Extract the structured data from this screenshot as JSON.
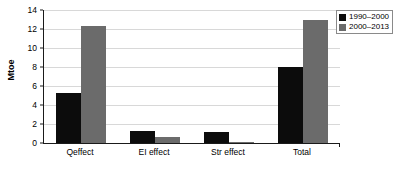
{
  "chart_data": {
    "type": "bar",
    "title": "",
    "xlabel": "",
    "ylabel": "Mtoe",
    "categories": [
      "Qeffect",
      "EI effect",
      "Str effect",
      "Total"
    ],
    "series": [
      {
        "name": "1990–2000",
        "color": "#0c0c0c",
        "values": [
          5.3,
          1.3,
          1.2,
          8.0
        ]
      },
      {
        "name": "2000–2013",
        "color": "#6b6b6b",
        "values": [
          12.3,
          0.6,
          0.1,
          13.0
        ]
      }
    ],
    "ylim": [
      0,
      14
    ],
    "yticks": [
      0,
      2,
      4,
      6,
      8,
      10,
      12,
      14
    ],
    "ytick_labels": [
      "0",
      "2",
      "4",
      "6",
      "8",
      "10",
      "12",
      "14"
    ],
    "grid": true,
    "grid_axis": "y",
    "legend_position": "outside-right-top",
    "background": "#ffffff",
    "axis_color": "#1a1a1a",
    "gridline_color": "#d8d8d8"
  }
}
